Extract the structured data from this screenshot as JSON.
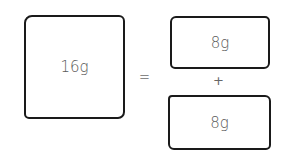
{
  "diagram": {
    "whole": {
      "label": "16g"
    },
    "operator_equals": "=",
    "parts": [
      {
        "label": "8g"
      },
      {
        "label": "8g"
      }
    ],
    "operator_plus": "+"
  }
}
